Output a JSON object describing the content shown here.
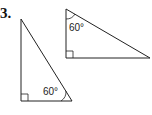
{
  "problem": {
    "number": "3."
  },
  "figures": [
    {
      "name": "triangle-1",
      "type": "right-triangle",
      "vertices": [
        [
          21,
          19
        ],
        [
          21,
          101
        ],
        [
          72,
          101
        ]
      ],
      "right_angle_at": "bottom-left",
      "angle_label": "60°",
      "angle_at": "bottom-right"
    },
    {
      "name": "triangle-2",
      "type": "right-triangle",
      "vertices": [
        [
          66,
          9
        ],
        [
          66,
          58
        ],
        [
          150,
          58
        ]
      ],
      "right_angle_at": "bottom-left",
      "angle_label": "60°",
      "angle_at": "top"
    }
  ]
}
